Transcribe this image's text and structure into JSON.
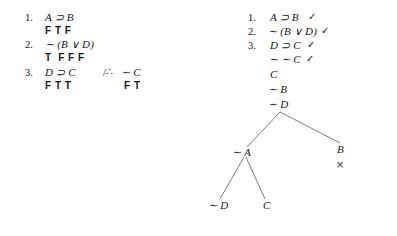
{
  "document": {
    "kind": "logic-exercise",
    "background_color": "#ffffff",
    "ink_color": "#17171a"
  },
  "truth_assignment": {
    "rows": [
      {
        "number": "1.",
        "formula": "A ⊃ B",
        "values": "F T F",
        "conclusion_marker": "",
        "conclusion_formula": "",
        "conclusion_values": ""
      },
      {
        "number": "2.",
        "formula": "∼ (B ∨ D)",
        "values": "T  F F F",
        "conclusion_marker": "",
        "conclusion_formula": "",
        "conclusion_values": ""
      },
      {
        "number": "3.",
        "formula": "D ⊃ C",
        "values": "F T T",
        "conclusion_marker": "/∴",
        "conclusion_formula": "∼ C",
        "conclusion_values": "F T"
      }
    ]
  },
  "truth_tree": {
    "stack": [
      {
        "number": "1.",
        "formula": "A ⊃ B",
        "check": "✓"
      },
      {
        "number": "2.",
        "formula": "∼ (B ∨ D)",
        "check": "✓"
      },
      {
        "number": "3.",
        "formula": "D ⊃ C",
        "check": "✓"
      },
      {
        "number": "",
        "formula": "∼ ∼ C",
        "check": "✓"
      },
      {
        "number": "",
        "formula": "C",
        "check": ""
      },
      {
        "number": "",
        "formula": "∼ B",
        "check": ""
      },
      {
        "number": "",
        "formula": "∼ D",
        "check": ""
      }
    ],
    "branch_nodes": [
      {
        "id": "left-branch-1",
        "label": "∼ A"
      },
      {
        "id": "right-branch-1",
        "label": "B"
      },
      {
        "id": "left-leaf-1",
        "label": "∼ D"
      },
      {
        "id": "left-leaf-2",
        "label": "C"
      }
    ],
    "closure_mark": "×",
    "line_color": "#6f6f78"
  }
}
